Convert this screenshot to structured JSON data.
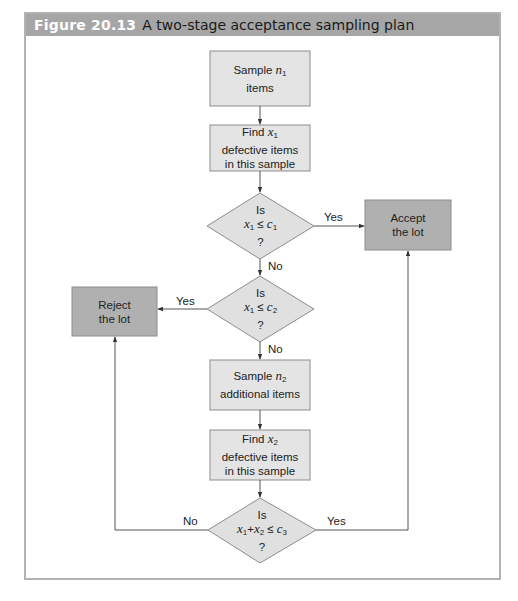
{
  "figure": {
    "number": "Figure 20.13",
    "title": "A two-stage acceptance sampling plan",
    "colors": {
      "header_bg": "#a6a6a6",
      "process_fill": "#e4e4e4",
      "decision_fill": "#e0e0e0",
      "terminal_fill": "#b0b0b0",
      "stroke": "#8c8c8c",
      "frame": "#b3b3b3"
    }
  },
  "nodes": {
    "sample_n1": {
      "line1_pre": "Sample ",
      "var": "n",
      "sub": "1",
      "line2": "items"
    },
    "find_x1": {
      "line1_pre": "Find ",
      "var": "x",
      "sub": "1",
      "line2": "defective items",
      "line3": "in this sample"
    },
    "decision1": {
      "line1": "Is",
      "expr_var1": "x",
      "expr_sub1": "1",
      "expr_op": " ≤ ",
      "expr_var2": "c",
      "expr_sub2": "1",
      "line3": "?"
    },
    "accept": {
      "line1": "Accept",
      "line2": "the lot"
    },
    "decision2": {
      "line1": "Is",
      "expr_var1": "x",
      "expr_sub1": "1",
      "expr_op": " ≤ ",
      "expr_var2": "c",
      "expr_sub2": "2",
      "line3": "?"
    },
    "reject": {
      "line1": "Reject",
      "line2": "the lot"
    },
    "sample_n2": {
      "line1_pre": "Sample ",
      "var": "n",
      "sub": "2",
      "line2": "additional items"
    },
    "find_x2": {
      "line1_pre": "Find ",
      "var": "x",
      "sub": "2",
      "line2": "defective items",
      "line3": "in this sample"
    },
    "decision3": {
      "line1": "Is",
      "expr_var1": "x",
      "expr_sub1": "1",
      "expr_plus": "+",
      "expr_var2": "x",
      "expr_sub2": "2",
      "expr_op": " ≤ ",
      "expr_var3": "c",
      "expr_sub3": "3",
      "line3": "?"
    }
  },
  "edges": {
    "d1_yes": "Yes",
    "d1_no": "No",
    "d2_yes": "Yes",
    "d2_no": "No",
    "d3_no": "No",
    "d3_yes": "Yes"
  }
}
